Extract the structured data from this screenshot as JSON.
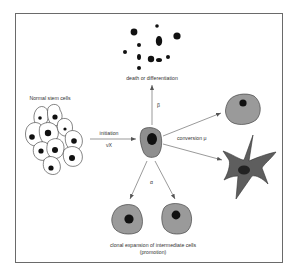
{
  "diagram": {
    "title": "",
    "labels": {
      "normal_stem_cells": "Normal stem cells",
      "initiation": "initiation",
      "initiation_rate": "νX",
      "death_or_differentiation": "death or differentiation",
      "beta": "β",
      "conversion": "conversion μ",
      "alpha": "α",
      "clonal_expansion_line1": "clonal expansion of intermediate cells",
      "clonal_expansion_line2": "(promotion)"
    },
    "nodes": [
      {
        "id": "normal-stem-cells",
        "label": "Normal stem cells",
        "shape": "cluster of outlined cells"
      },
      {
        "id": "initiated-cell",
        "label": "",
        "shape": "grey cell with dark nucleus"
      },
      {
        "id": "dead-cells",
        "label": "death or differentiation",
        "shape": "scattered black dots"
      },
      {
        "id": "malignant-round-cell",
        "label": "",
        "shape": "grey round cell"
      },
      {
        "id": "malignant-stellate-cell",
        "label": "",
        "shape": "dark stellate cell"
      },
      {
        "id": "intermediate-cell-left",
        "label": "",
        "shape": "grey cell"
      },
      {
        "id": "intermediate-cell-right",
        "label": "",
        "shape": "grey cell"
      }
    ],
    "edges": [
      {
        "from": "normal-stem-cells",
        "to": "initiated-cell",
        "label": "initiation νX"
      },
      {
        "from": "initiated-cell",
        "to": "dead-cells",
        "label": "β"
      },
      {
        "from": "initiated-cell",
        "to": "malignant-round-cell",
        "label": "conversion μ"
      },
      {
        "from": "initiated-cell",
        "to": "malignant-stellate-cell",
        "label": "conversion μ"
      },
      {
        "from": "initiated-cell",
        "to": "intermediate-cell-left",
        "label": "α"
      },
      {
        "from": "initiated-cell",
        "to": "intermediate-cell-right",
        "label": "α"
      }
    ],
    "colors": {
      "frame": "#6a6a6a",
      "cell_fill": "#9a9a9a",
      "stellate_fill": "#5e5e5e",
      "nucleus": "#111111",
      "arrow": "#555555"
    }
  }
}
